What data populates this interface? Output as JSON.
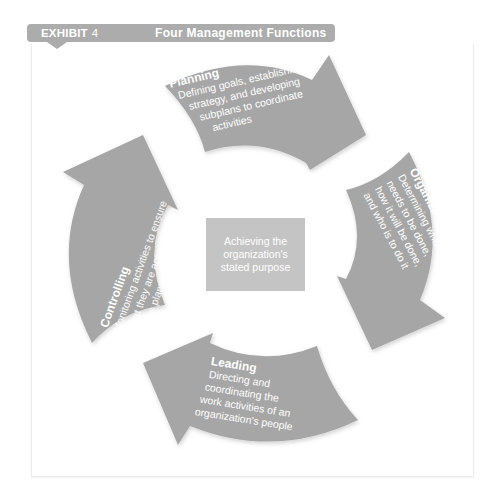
{
  "header": {
    "exhibit_label": "EXHIBIT",
    "exhibit_number": "4",
    "title": "Four Management Functions"
  },
  "center": {
    "text": "Achieving the organization's stated purpose"
  },
  "functions": [
    {
      "title": "Planning",
      "lines": [
        "Defining goals, establishing",
        "strategy, and developing",
        "subplans to coordinate",
        "activities"
      ]
    },
    {
      "title": "Organizing",
      "lines": [
        "Determining what",
        "needs to be done,",
        "how it will be done,",
        "and who is to do it"
      ]
    },
    {
      "title": "Leading",
      "lines": [
        "Directing and",
        "coordinating the",
        "work activities of an",
        "organization's people"
      ]
    },
    {
      "title": "Controlling",
      "lines": [
        "Monitoring activities to ensure",
        "that they are accomplished",
        "as planned"
      ]
    }
  ],
  "colors": {
    "arrow": "#a6a6a6",
    "header": "#acacac",
    "center_box": "#c4c4c4",
    "text": "#ffffff"
  }
}
